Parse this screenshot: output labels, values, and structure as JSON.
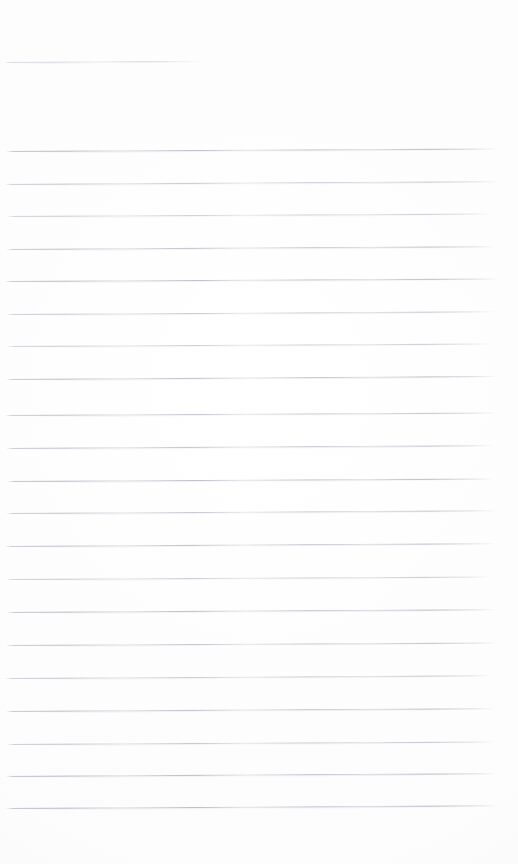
{
  "document": {
    "type": "scanned-ruled-page",
    "description": "Blank faded scan of lined notebook paper",
    "page_width": 518,
    "page_height": 864,
    "background_color": "#ffffff",
    "rule_color": "#b4b4c0",
    "rule_thickness_px": 1,
    "rule_spacing_px": 32.6,
    "text_content": "",
    "visible_text": []
  },
  "header_rule": {
    "label": "header-rule",
    "x": 4,
    "y": 62,
    "width": 204,
    "slope_deg": -0.35,
    "opacity": 0.75
  },
  "body_rules": [
    {
      "index": 1,
      "y": 151,
      "x": 6,
      "width": 492,
      "slope_deg": -0.3,
      "opacity": 0.95
    },
    {
      "index": 2,
      "y": 184,
      "x": 5,
      "width": 494,
      "slope_deg": -0.32,
      "opacity": 0.8
    },
    {
      "index": 3,
      "y": 216,
      "x": 7,
      "width": 486,
      "slope_deg": -0.28,
      "opacity": 0.7
    },
    {
      "index": 4,
      "y": 249,
      "x": 6,
      "width": 490,
      "slope_deg": -0.33,
      "opacity": 0.88
    },
    {
      "index": 5,
      "y": 281,
      "x": 5,
      "width": 494,
      "slope_deg": -0.3,
      "opacity": 0.92
    },
    {
      "index": 6,
      "y": 314,
      "x": 6,
      "width": 489,
      "slope_deg": -0.31,
      "opacity": 0.78
    },
    {
      "index": 7,
      "y": 346,
      "x": 7,
      "width": 485,
      "slope_deg": -0.29,
      "opacity": 0.72
    },
    {
      "index": 8,
      "y": 379,
      "x": 6,
      "width": 492,
      "slope_deg": -0.34,
      "opacity": 0.9
    },
    {
      "index": 9,
      "y": 415,
      "x": 5,
      "width": 493,
      "slope_deg": -0.3,
      "opacity": 0.83
    },
    {
      "index": 10,
      "y": 448,
      "x": 6,
      "width": 488,
      "slope_deg": -0.32,
      "opacity": 0.86
    },
    {
      "index": 11,
      "y": 481,
      "x": 7,
      "width": 487,
      "slope_deg": -0.3,
      "opacity": 0.94
    },
    {
      "index": 12,
      "y": 513,
      "x": 6,
      "width": 491,
      "slope_deg": -0.31,
      "opacity": 0.8
    },
    {
      "index": 13,
      "y": 546,
      "x": 5,
      "width": 490,
      "slope_deg": -0.33,
      "opacity": 0.88
    },
    {
      "index": 14,
      "y": 579,
      "x": 6,
      "width": 486,
      "slope_deg": -0.29,
      "opacity": 0.75
    },
    {
      "index": 15,
      "y": 612,
      "x": 7,
      "width": 489,
      "slope_deg": -0.32,
      "opacity": 0.93
    },
    {
      "index": 16,
      "y": 645,
      "x": 6,
      "width": 492,
      "slope_deg": -0.3,
      "opacity": 0.85
    },
    {
      "index": 17,
      "y": 678,
      "x": 5,
      "width": 488,
      "slope_deg": -0.31,
      "opacity": 0.79
    },
    {
      "index": 18,
      "y": 711,
      "x": 6,
      "width": 490,
      "slope_deg": -0.33,
      "opacity": 0.9
    },
    {
      "index": 19,
      "y": 744,
      "x": 7,
      "width": 487,
      "slope_deg": -0.3,
      "opacity": 0.82
    },
    {
      "index": 20,
      "y": 776,
      "x": 6,
      "width": 491,
      "slope_deg": -0.32,
      "opacity": 0.96
    },
    {
      "index": 21,
      "y": 808,
      "x": 6,
      "width": 492,
      "slope_deg": -0.31,
      "opacity": 0.97
    }
  ]
}
